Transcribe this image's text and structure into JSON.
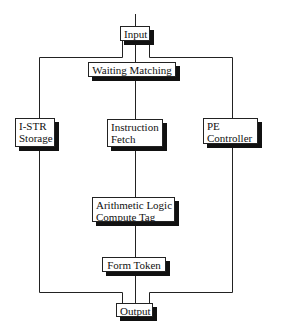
{
  "diagram": {
    "type": "block-diagram",
    "nodes": [
      {
        "id": "input",
        "label": "Input"
      },
      {
        "id": "waiting_matching",
        "label": "Waiting Matching"
      },
      {
        "id": "istr_storage",
        "lines": [
          "I-STR",
          "Storage"
        ]
      },
      {
        "id": "instruction_fetch",
        "lines": [
          "Instruction",
          "Fetch"
        ]
      },
      {
        "id": "pe_controller",
        "lines": [
          "PE",
          "Controller"
        ]
      },
      {
        "id": "alu_compute_tag",
        "lines": [
          "Arithmetic Logic",
          "Compute Tag"
        ]
      },
      {
        "id": "form_token",
        "label": "Form Token"
      },
      {
        "id": "output",
        "label": "Output"
      }
    ],
    "edges": [
      {
        "from": "external",
        "to": "input"
      },
      {
        "from": "input",
        "to": "waiting_matching"
      },
      {
        "from": "input",
        "to": "istr_storage"
      },
      {
        "from": "input",
        "to": "pe_controller"
      },
      {
        "from": "waiting_matching",
        "to": "instruction_fetch"
      },
      {
        "from": "instruction_fetch",
        "to": "alu_compute_tag"
      },
      {
        "from": "alu_compute_tag",
        "to": "form_token"
      },
      {
        "from": "form_token",
        "to": "output"
      },
      {
        "from": "istr_storage",
        "to": "output"
      },
      {
        "from": "pe_controller",
        "to": "output"
      }
    ],
    "colors": {
      "line": "#222222",
      "box_fill": "#ffffff",
      "shadow": "#111111"
    }
  }
}
